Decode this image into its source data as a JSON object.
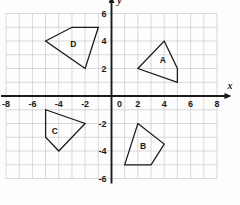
{
  "chart_data": {
    "type": "scatter",
    "title": "",
    "xlabel": "x",
    "ylabel": "y",
    "xlim": [
      -8,
      8
    ],
    "ylim": [
      -6,
      6
    ],
    "grid": true,
    "grid_step": 1,
    "legend": "none",
    "x_tick_labels": [
      "-8",
      "-6",
      "-4",
      "-2",
      "0",
      "2",
      "4",
      "6",
      "8"
    ],
    "x_tick_values": [
      -8,
      -6,
      -4,
      -2,
      0,
      2,
      4,
      6,
      8
    ],
    "y_tick_labels": [
      "6",
      "4",
      "2",
      "-2",
      "-4",
      "-6"
    ],
    "y_tick_values": [
      6,
      4,
      2,
      -2,
      -4,
      -6
    ],
    "origin_label": "0",
    "shapes": [
      {
        "name": "A",
        "label": "A",
        "label_x": 3.9,
        "label_y": 2.6,
        "vertices": [
          [
            2,
            2
          ],
          [
            4,
            4
          ],
          [
            5,
            2
          ],
          [
            5,
            1
          ]
        ]
      },
      {
        "name": "B",
        "label": "B",
        "label_x": 2.4,
        "label_y": -3.7,
        "vertices": [
          [
            2,
            -2
          ],
          [
            4,
            -3.5
          ],
          [
            3,
            -5
          ],
          [
            1,
            -5
          ]
        ]
      },
      {
        "name": "C",
        "label": "C",
        "label_x": -4.3,
        "label_y": -2.6,
        "vertices": [
          [
            -5,
            -1
          ],
          [
            -2,
            -2
          ],
          [
            -4,
            -4
          ],
          [
            -5,
            -3
          ]
        ]
      },
      {
        "name": "D",
        "label": "D",
        "label_x": -2.9,
        "label_y": 3.7,
        "vertices": [
          [
            -5,
            4
          ],
          [
            -3,
            5
          ],
          [
            -1,
            5
          ],
          [
            -2,
            2
          ]
        ]
      }
    ]
  },
  "axes": {
    "x_axis_name": "x",
    "y_axis_name": "y"
  }
}
